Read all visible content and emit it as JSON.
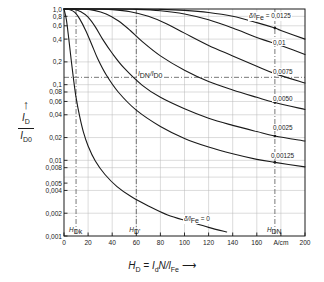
{
  "figure": {
    "y_axis_caption_arrow": "↑",
    "y_axis_numerator": "I",
    "y_axis_numerator_sub": "D",
    "y_axis_denominator": "I",
    "y_axis_denominator_sub": "D0",
    "x_axis_caption": "H",
    "x_axis_caption_sub": "D",
    "x_axis_caption_rest": " = I",
    "x_axis_caption_sub2": "d",
    "x_axis_caption_rest2": "N/l",
    "x_axis_caption_sub3": "Fe",
    "x_axis_caption_arrow": "⟶",
    "x_unit": "A/cm",
    "inner_ratio_label": "I",
    "inner_ratio_sub": "DN",
    "inner_ratio_mid": "/I",
    "inner_ratio_sub2": "D0",
    "marker_1": "H",
    "marker_1_sub": "Dk",
    "marker_2": "H",
    "marker_2_sub": "D'",
    "marker_3": "H",
    "marker_3_sub": "DN",
    "line_color": "#1a1a1a",
    "grid_color": "#b9b9b9",
    "dash_color": "#555555"
  },
  "chart_data": {
    "type": "line",
    "title": "",
    "xlabel": "H_D = I_d N / l_Fe",
    "ylabel": "I_D / I_D0",
    "xlim": [
      0,
      200
    ],
    "ylim": [
      0.001,
      1.0
    ],
    "yscale": "log",
    "grid": true,
    "legend": "inline-curve-labels",
    "x_ticks": [
      0,
      20,
      40,
      60,
      80,
      100,
      120,
      140,
      160,
      180,
      200
    ],
    "x_tick_labels": [
      "0",
      "20",
      "40",
      "60",
      "80",
      "100",
      "120",
      "140",
      "160",
      "A/cm",
      "200"
    ],
    "y_ticks": [
      1.0,
      0.8,
      0.6,
      0.4,
      0.2,
      0.1,
      0.08,
      0.06,
      0.04,
      0.02,
      0.01,
      0.008,
      0.005,
      0.004,
      0.002,
      0.001
    ],
    "y_tick_labels": [
      "1,0",
      "0,8",
      "0,6",
      "0,4",
      "0,2",
      "0,1",
      "0,08",
      "0,06",
      "0,04",
      "0,02",
      "0,01",
      "0,008",
      "0,005",
      "0,004",
      "0,002",
      "0,001"
    ],
    "y_gridlines": [
      1.0,
      0.8,
      0.6,
      0.4,
      0.2,
      0.1,
      0.08,
      0.06,
      0.04,
      0.02,
      0.01,
      0.008,
      0.006,
      0.004,
      0.002,
      0.001
    ],
    "reference_lines": [
      {
        "kind": "vertical",
        "value": 10,
        "style": "dash-dot",
        "label": "H_Dk"
      },
      {
        "kind": "vertical",
        "value": 60,
        "style": "dash-dot",
        "label": "H_D'"
      },
      {
        "kind": "vertical",
        "value": 175,
        "style": "dash-dot",
        "label": "H_DN"
      },
      {
        "kind": "horizontal",
        "value": 0.125,
        "style": "dash-dot",
        "label": "I_DN/I_D0"
      }
    ],
    "series": [
      {
        "name": "δ/l_Fe = 0,0125",
        "label": "0,0125",
        "points": [
          [
            0,
            1.0
          ],
          [
            60,
            1.0
          ],
          [
            80,
            0.99
          ],
          [
            100,
            0.96
          ],
          [
            120,
            0.9
          ],
          [
            140,
            0.8
          ],
          [
            160,
            0.66
          ],
          [
            175,
            0.56
          ],
          [
            180,
            0.52
          ],
          [
            200,
            0.4
          ]
        ]
      },
      {
        "name": "δ/l_Fe = 0,01",
        "label": "0,01",
        "points": [
          [
            0,
            1.0
          ],
          [
            40,
            1.0
          ],
          [
            60,
            0.99
          ],
          [
            80,
            0.95
          ],
          [
            100,
            0.86
          ],
          [
            120,
            0.72
          ],
          [
            140,
            0.56
          ],
          [
            160,
            0.42
          ],
          [
            175,
            0.35
          ],
          [
            180,
            0.33
          ],
          [
            200,
            0.25
          ]
        ]
      },
      {
        "name": "δ/l_Fe = 0,0075",
        "label": "0,0075",
        "points": [
          [
            0,
            1.0
          ],
          [
            25,
            1.0
          ],
          [
            40,
            0.98
          ],
          [
            55,
            0.92
          ],
          [
            70,
            0.8
          ],
          [
            85,
            0.64
          ],
          [
            100,
            0.48
          ],
          [
            120,
            0.33
          ],
          [
            140,
            0.24
          ],
          [
            160,
            0.175
          ],
          [
            175,
            0.14
          ],
          [
            200,
            0.105
          ]
        ]
      },
      {
        "name": "δ/l_Fe = 0,0050",
        "label": "0,0050",
        "points": [
          [
            0,
            1.0
          ],
          [
            15,
            1.0
          ],
          [
            25,
            0.96
          ],
          [
            35,
            0.86
          ],
          [
            45,
            0.7
          ],
          [
            55,
            0.52
          ],
          [
            65,
            0.37
          ],
          [
            80,
            0.24
          ],
          [
            100,
            0.155
          ],
          [
            120,
            0.11
          ],
          [
            140,
            0.085
          ],
          [
            160,
            0.068
          ],
          [
            175,
            0.058
          ],
          [
            200,
            0.047
          ]
        ]
      },
      {
        "name": "δ/l_Fe = 0,0025",
        "label": "0,0025",
        "points": [
          [
            0,
            1.0
          ],
          [
            8,
            0.99
          ],
          [
            14,
            0.92
          ],
          [
            20,
            0.78
          ],
          [
            26,
            0.58
          ],
          [
            32,
            0.4
          ],
          [
            40,
            0.26
          ],
          [
            50,
            0.165
          ],
          [
            65,
            0.098
          ],
          [
            80,
            0.068
          ],
          [
            100,
            0.048
          ],
          [
            120,
            0.036
          ],
          [
            140,
            0.029
          ],
          [
            160,
            0.024
          ],
          [
            175,
            0.021
          ],
          [
            200,
            0.018
          ]
        ]
      },
      {
        "name": "δ/l_Fe = 0,00125",
        "label": "0,00125",
        "points": [
          [
            0,
            1.0
          ],
          [
            5,
            0.98
          ],
          [
            9,
            0.9
          ],
          [
            13,
            0.74
          ],
          [
            18,
            0.52
          ],
          [
            23,
            0.34
          ],
          [
            28,
            0.22
          ],
          [
            35,
            0.135
          ],
          [
            45,
            0.08
          ],
          [
            60,
            0.046
          ],
          [
            80,
            0.028
          ],
          [
            100,
            0.0195
          ],
          [
            120,
            0.015
          ],
          [
            140,
            0.0122
          ],
          [
            160,
            0.0103
          ],
          [
            175,
            0.0094
          ],
          [
            200,
            0.0082
          ]
        ]
      },
      {
        "name": "δ/l_Fe = 0",
        "label": "0",
        "points": [
          [
            0,
            1.0
          ],
          [
            2,
            0.72
          ],
          [
            4,
            0.4
          ],
          [
            6,
            0.21
          ],
          [
            8,
            0.115
          ],
          [
            10,
            0.068
          ],
          [
            13,
            0.038
          ],
          [
            16,
            0.024
          ],
          [
            20,
            0.0155
          ],
          [
            26,
            0.0098
          ],
          [
            34,
            0.0065
          ],
          [
            44,
            0.0045
          ],
          [
            56,
            0.0033
          ],
          [
            70,
            0.0025
          ],
          [
            86,
            0.0019
          ],
          [
            104,
            0.00155
          ],
          [
            120,
            0.0013
          ],
          [
            135,
            0.00113
          ]
        ]
      }
    ]
  }
}
